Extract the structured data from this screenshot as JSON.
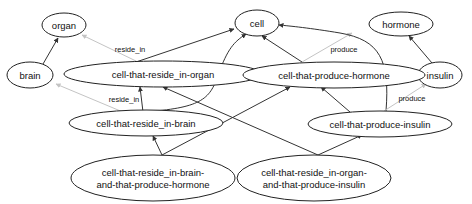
{
  "diagram": {
    "type": "directed-graph",
    "nodes": {
      "organ": "organ",
      "brain": "brain",
      "cell": "cell",
      "hormone": "hormone",
      "insulin": "insulin",
      "cell_reside_organ": "cell-that-reside_in-organ",
      "cell_produce_hormone": "cell-that-produce-hormone",
      "cell_reside_brain": "cell-that-reside_in-brain",
      "cell_produce_insulin": "cell-that-produce-insulin",
      "cell_brain_hormone_line1": "cell-that-reside_in-brain-",
      "cell_brain_hormone_line2": "and-that-produce-hormone",
      "cell_organ_insulin_line1": "cell-that-reside_in-organ-",
      "cell_organ_insulin_line2": "and-that-produce-insulin"
    },
    "edge_labels": {
      "reside_in_organ": "reside_in",
      "reside_in_brain": "reside_in",
      "produce_hormone": "produce",
      "produce_insulin": "produce"
    },
    "edges": [
      {
        "from": "brain",
        "to": "organ",
        "style": "dark"
      },
      {
        "from": "insulin",
        "to": "hormone",
        "style": "dark"
      },
      {
        "from": "cell-that-reside_in-organ",
        "to": "organ",
        "label": "reside_in",
        "style": "light"
      },
      {
        "from": "cell-that-reside_in-organ",
        "to": "cell",
        "style": "dark"
      },
      {
        "from": "cell-that-produce-hormone",
        "to": "cell",
        "style": "dark"
      },
      {
        "from": "cell-that-produce-hormone",
        "to": "hormone",
        "label": "produce",
        "style": "light"
      },
      {
        "from": "cell-that-reside_in-brain",
        "to": "brain",
        "label": "reside_in",
        "style": "light"
      },
      {
        "from": "cell-that-reside_in-brain",
        "to": "cell",
        "style": "dark"
      },
      {
        "from": "cell-that-produce-insulin",
        "to": "cell",
        "style": "dark"
      },
      {
        "from": "cell-that-produce-insulin",
        "to": "insulin",
        "label": "produce",
        "style": "light"
      },
      {
        "from": "cell-that-produce-insulin",
        "to": "cell-that-produce-hormone",
        "style": "dark"
      },
      {
        "from": "cell-that-reside_in-brain-and-that-produce-hormone",
        "to": "cell-that-reside_in-brain",
        "style": "dark"
      },
      {
        "from": "cell-that-reside_in-brain-and-that-produce-hormone",
        "to": "cell-that-produce-hormone",
        "style": "dark"
      },
      {
        "from": "cell-that-reside_in-organ-and-that-produce-insulin",
        "to": "cell-that-reside_in-organ",
        "style": "dark"
      },
      {
        "from": "cell-that-reside_in-organ-and-that-produce-insulin",
        "to": "cell-that-produce-insulin",
        "style": "dark"
      }
    ],
    "colors": {
      "node_stroke": "#222222",
      "edge_dark": "#333333",
      "edge_light": "#c4c4c4",
      "background": "#ffffff"
    }
  }
}
